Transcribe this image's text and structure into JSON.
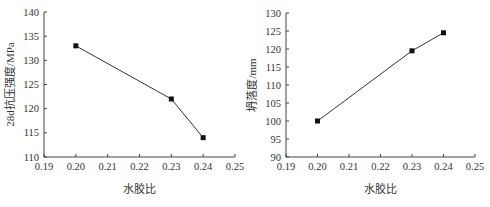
{
  "chart_data": [
    {
      "type": "line",
      "title": "",
      "xlabel": "水胶比",
      "ylabel": "28d抗压强度/MPa",
      "x": [
        0.2,
        0.23,
        0.24
      ],
      "values": [
        133,
        122,
        114
      ],
      "xlim": [
        0.19,
        0.25
      ],
      "ylim": [
        110,
        140
      ],
      "xticks": [
        "0.19",
        "0.20",
        "0.21",
        "0.22",
        "0.23",
        "0.24",
        "0.25"
      ],
      "yticks": [
        "110",
        "115",
        "120",
        "125",
        "130",
        "135",
        "140"
      ],
      "marker": "square",
      "grid": false
    },
    {
      "type": "line",
      "title": "",
      "xlabel": "水胶比",
      "ylabel": "坍落度/mm",
      "x": [
        0.2,
        0.23,
        0.24
      ],
      "values": [
        100,
        119.5,
        124.5
      ],
      "xlim": [
        0.19,
        0.25
      ],
      "ylim": [
        90,
        130
      ],
      "xticks": [
        "0.19",
        "0.20",
        "0.21",
        "0.22",
        "0.23",
        "0.24",
        "0.25"
      ],
      "yticks": [
        "90",
        "95",
        "100",
        "105",
        "110",
        "115",
        "120",
        "125",
        "130"
      ],
      "marker": "square",
      "grid": false
    }
  ]
}
